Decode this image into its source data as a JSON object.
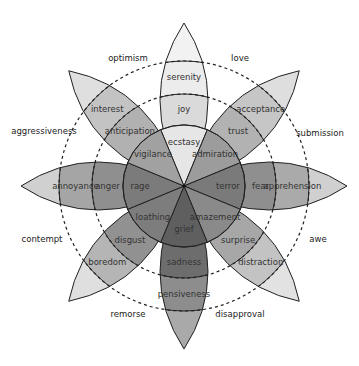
{
  "diagram": {
    "center": [
      184,
      186
    ],
    "radii": {
      "inner": 61,
      "middle": 92,
      "outer": 125,
      "tip": 163
    },
    "petals": [
      {
        "angle": -90,
        "segments": [
          "ecstasy",
          "joy",
          "serenity"
        ],
        "colors": [
          "#e6e6e6",
          "#dadada",
          "#ececec",
          "#f2f2f2"
        ]
      },
      {
        "angle": -45,
        "segments": [
          "admiration",
          "trust",
          "acceptance"
        ],
        "colors": [
          "#9c9c9c",
          "#b2b2b2",
          "#c6c6c6",
          "#dedede"
        ]
      },
      {
        "angle": 0,
        "segments": [
          "terror",
          "fear",
          "apprehension"
        ],
        "colors": [
          "#7a7a7a",
          "#8f8f8f",
          "#aaaaaa",
          "#d0d0d0"
        ]
      },
      {
        "angle": 45,
        "segments": [
          "amazement",
          "surprise",
          "distraction"
        ],
        "colors": [
          "#8a8a8a",
          "#a7a7a7",
          "#c3c3c3",
          "#e2e2e2"
        ]
      },
      {
        "angle": 90,
        "segments": [
          "grief",
          "sadness",
          "pensiveness"
        ],
        "colors": [
          "#5f5f5f",
          "#6d6d6d",
          "#8d8d8d",
          "#a9a9a9"
        ]
      },
      {
        "angle": 135,
        "segments": [
          "loathing",
          "disgust",
          "boredom"
        ],
        "colors": [
          "#7d7d7d",
          "#919191",
          "#b5b5b5",
          "#dfdfdf"
        ]
      },
      {
        "angle": 180,
        "segments": [
          "rage",
          "anger",
          "annoyance"
        ],
        "colors": [
          "#7b7b7b",
          "#8f8f8f",
          "#a5a5a5",
          "#d0d0d0"
        ]
      },
      {
        "angle": -135,
        "segments": [
          "vigilance",
          "anticipation",
          "interest"
        ],
        "colors": [
          "#a1a1a1",
          "#b1b1b1",
          "#c3c3c3",
          "#dfdfdf"
        ]
      }
    ],
    "dyads": [
      {
        "label": "optimism",
        "x": 128,
        "y": 58
      },
      {
        "label": "love",
        "x": 240,
        "y": 58
      },
      {
        "label": "submission",
        "x": 320,
        "y": 133
      },
      {
        "label": "awe",
        "x": 318,
        "y": 239
      },
      {
        "label": "disapproval",
        "x": 240,
        "y": 314
      },
      {
        "label": "remorse",
        "x": 128,
        "y": 314
      },
      {
        "label": "contempt",
        "x": 42,
        "y": 239
      },
      {
        "label": "aggressiveness",
        "x": 44,
        "y": 131
      }
    ]
  }
}
